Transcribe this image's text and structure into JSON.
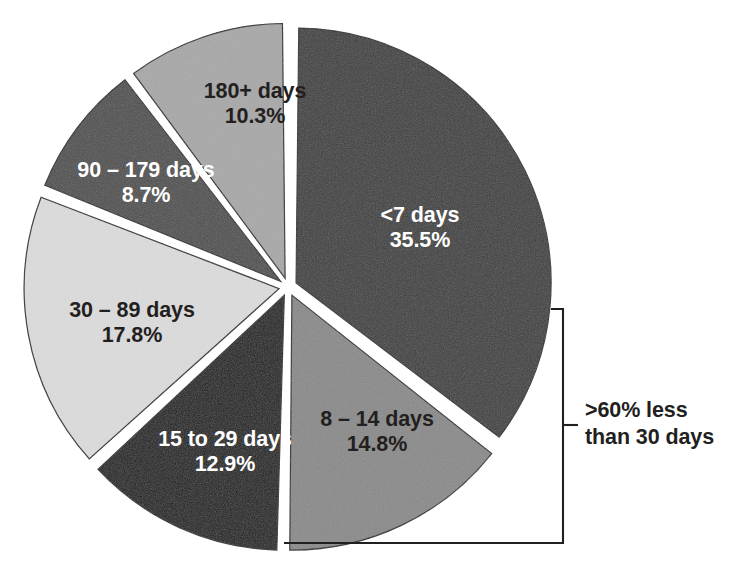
{
  "chart_data": {
    "type": "pie",
    "title": "",
    "subtitle": "",
    "xlabel": "",
    "ylabel": "",
    "legend_position": "none",
    "grid": false,
    "value_unit": "percent",
    "total": 100.0,
    "categories": [
      "<7 days",
      "8 – 14 days",
      "15 to 29 days",
      "30 – 89 days",
      "90 – 179 days",
      "180+ days"
    ],
    "values": [
      35.5,
      14.8,
      12.9,
      17.8,
      8.7,
      10.3
    ],
    "slices": [
      {
        "label": "<7 days",
        "percent_text": "35.5%",
        "value": 35.5,
        "color": "#3f3f3f",
        "text_color": "#ffffff",
        "exploded": true
      },
      {
        "label": "8 – 14 days",
        "percent_text": "14.8%",
        "value": 14.8,
        "color": "#8a8a8a",
        "text_color": "#231f20",
        "exploded": true
      },
      {
        "label": "15 to 29 days",
        "percent_text": "12.9%",
        "value": 12.9,
        "color": "#1c1c1c",
        "text_color": "#ffffff",
        "exploded": true
      },
      {
        "label": "30 – 89 days",
        "percent_text": "17.8%",
        "value": 17.8,
        "color": "#dcdcdc",
        "text_color": "#231f20",
        "exploded": true
      },
      {
        "label": "90 – 179 days",
        "percent_text": "8.7%",
        "value": 8.7,
        "color": "#4f4f4f",
        "text_color": "#ffffff",
        "exploded": true
      },
      {
        "label": "180+ days",
        "percent_text": "10.3%",
        "value": 10.3,
        "color": "#a8a8a8",
        "text_color": "#231f20",
        "exploded": true
      }
    ],
    "annotations": [
      {
        "name": "bracket-callout",
        "line1": ">60% less",
        "line2": "than 30 days",
        "covers_categories": [
          "<7 days",
          "8 – 14 days",
          "15 to 29 days"
        ],
        "covers_percent": 63.2,
        "bracket_color": "#231f20"
      }
    ]
  }
}
